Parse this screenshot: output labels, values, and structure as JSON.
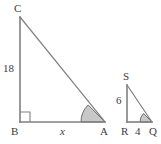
{
  "figure": {
    "background_color": "#ffffff",
    "stroke_color": "#808080",
    "label_color": "#3c3c3c",
    "angle_fill_color": "#c8c8c8",
    "angle_stroke_color": "#6e6e6e",
    "width": 161,
    "height": 144
  },
  "large_triangle": {
    "name": "triangle-ABC",
    "vertices": {
      "C": {
        "label": "C",
        "x": 20,
        "y": 17
      },
      "B": {
        "label": "B",
        "x": 20,
        "y": 122
      },
      "A": {
        "label": "A",
        "x": 105,
        "y": 122
      }
    },
    "sides": {
      "BC": {
        "label": "18",
        "italic": false
      },
      "BA": {
        "label": "x",
        "italic": true
      },
      "CA": {
        "label": "",
        "italic": false
      }
    },
    "right_angle_at": "B",
    "marked_angle_at": "A"
  },
  "small_triangle": {
    "name": "triangle-QRS",
    "vertices": {
      "S": {
        "label": "S",
        "x": 127,
        "y": 85
      },
      "R": {
        "label": "R",
        "x": 127,
        "y": 122
      },
      "Q": {
        "label": "Q",
        "x": 152,
        "y": 122
      }
    },
    "sides": {
      "SR": {
        "label": "6",
        "italic": false
      },
      "RQ": {
        "label": "4",
        "italic": false
      },
      "SQ": {
        "label": "",
        "italic": false
      }
    },
    "right_angle_at": "R",
    "marked_angle_at": "Q"
  },
  "labels": {
    "C": "C",
    "B": "B",
    "A": "A",
    "eighteen": "18",
    "x": "x",
    "S": "S",
    "R": "R",
    "Q": "Q",
    "six": "6",
    "four": "4"
  }
}
